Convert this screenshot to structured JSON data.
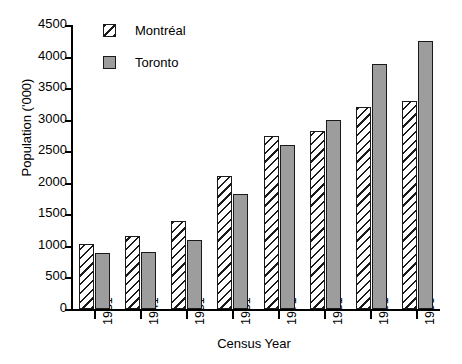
{
  "chart_data": {
    "type": "bar",
    "title": "",
    "xlabel": "Census Year",
    "ylabel": "Population ('000)",
    "categories": [
      "1931",
      "1941",
      "1951",
      "1961",
      "1971",
      "1981",
      "1991",
      "1996"
    ],
    "series": [
      {
        "name": "Montréal",
        "fill": "diagonal-hatch",
        "color": "#ffffff",
        "values": [
          1030,
          1160,
          1400,
          2110,
          2740,
          2820,
          3200,
          3300
        ]
      },
      {
        "name": "Toronto",
        "fill": "solid-gray",
        "color": "#9d9d9d",
        "values": [
          890,
          900,
          1100,
          1820,
          2600,
          2990,
          3890,
          4240
        ]
      }
    ],
    "ylim": [
      0,
      4500
    ],
    "yticks": [
      0,
      500,
      1000,
      1500,
      2000,
      2500,
      3000,
      3500,
      4000,
      4500
    ],
    "ytick_labels": [
      "0",
      "500",
      "1000",
      "1500",
      "2000",
      "2500",
      "3000",
      "3500",
      "4000",
      "4500"
    ],
    "grid": false,
    "legend_position": "top-left-inside",
    "legend": [
      {
        "label": "Montréal"
      },
      {
        "label": "Toronto"
      }
    ]
  }
}
